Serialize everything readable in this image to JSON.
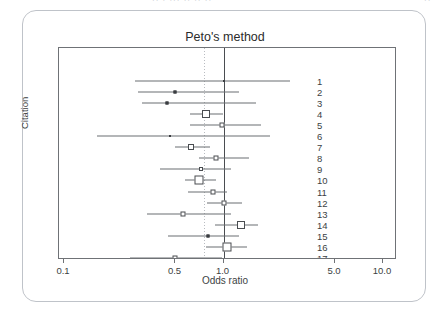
{
  "page": {
    "top_fragment_left": "·· · ··· ·· ·· ··",
    "top_fragment_right": "··"
  },
  "chart_data": {
    "type": "forest",
    "title": "Peto's method",
    "xlabel": "Odds ratio",
    "ylabel": "Citation",
    "xscale": "log",
    "xlim": [
      0.1,
      10.0
    ],
    "xticks": [
      0.1,
      0.5,
      1.0,
      5.0,
      10.0
    ],
    "xtick_labels": [
      "0.1",
      "0.5",
      "1.0",
      "5.0",
      "10.0"
    ],
    "grid": false,
    "null_line": 1.0,
    "pooled_line": 0.76,
    "combined_label": "Combined : fixed",
    "combined": {
      "or": 0.76,
      "lower": 0.62,
      "upper": 0.93
    },
    "categories": [
      "1",
      "2",
      "3",
      "4",
      "5",
      "6",
      "7",
      "8",
      "9",
      "10",
      "11",
      "12",
      "13",
      "14",
      "15",
      "16",
      "17"
    ],
    "studies": [
      {
        "label": "1",
        "or": 1.0,
        "lower": 0.28,
        "upper": 2.6,
        "marker": "dot",
        "size": 2
      },
      {
        "label": "2",
        "or": 0.5,
        "lower": 0.29,
        "upper": 1.25,
        "marker": "dot",
        "size": 3
      },
      {
        "label": "3",
        "or": 0.44,
        "lower": 0.31,
        "upper": 1.6,
        "marker": "dot",
        "size": 3
      },
      {
        "label": "4",
        "or": 0.78,
        "lower": 0.62,
        "upper": 1.0,
        "marker": "square",
        "size": 8
      },
      {
        "label": "5",
        "or": 0.98,
        "lower": 0.62,
        "upper": 1.72,
        "marker": "square",
        "size": 5
      },
      {
        "label": "6",
        "or": 0.46,
        "lower": 0.16,
        "upper": 1.95,
        "marker": "dot",
        "size": 2
      },
      {
        "label": "7",
        "or": 0.63,
        "lower": 0.5,
        "upper": 0.82,
        "marker": "square",
        "size": 6
      },
      {
        "label": "8",
        "or": 0.9,
        "lower": 0.7,
        "upper": 1.45,
        "marker": "square",
        "size": 5
      },
      {
        "label": "9",
        "or": 0.72,
        "lower": 0.4,
        "upper": 1.12,
        "marker": "square",
        "size": 4
      },
      {
        "label": "10",
        "or": 0.7,
        "lower": 0.57,
        "upper": 0.9,
        "marker": "square",
        "size": 9
      },
      {
        "label": "11",
        "or": 0.86,
        "lower": 0.6,
        "upper": 1.05,
        "marker": "square",
        "size": 5
      },
      {
        "label": "12",
        "or": 1.0,
        "lower": 0.79,
        "upper": 1.3,
        "marker": "square",
        "size": 5
      },
      {
        "label": "13",
        "or": 0.56,
        "lower": 0.33,
        "upper": 1.12,
        "marker": "square",
        "size": 5
      },
      {
        "label": "14",
        "or": 1.28,
        "lower": 0.89,
        "upper": 1.65,
        "marker": "square",
        "size": 8
      },
      {
        "label": "15",
        "or": 0.8,
        "lower": 0.45,
        "upper": 1.25,
        "marker": "dot",
        "size": 3
      },
      {
        "label": "16",
        "or": 1.05,
        "lower": 0.78,
        "upper": 1.4,
        "marker": "square",
        "size": 9
      },
      {
        "label": "17",
        "or": 0.5,
        "lower": 0.26,
        "upper": 0.98,
        "marker": "square",
        "size": 5
      }
    ]
  }
}
